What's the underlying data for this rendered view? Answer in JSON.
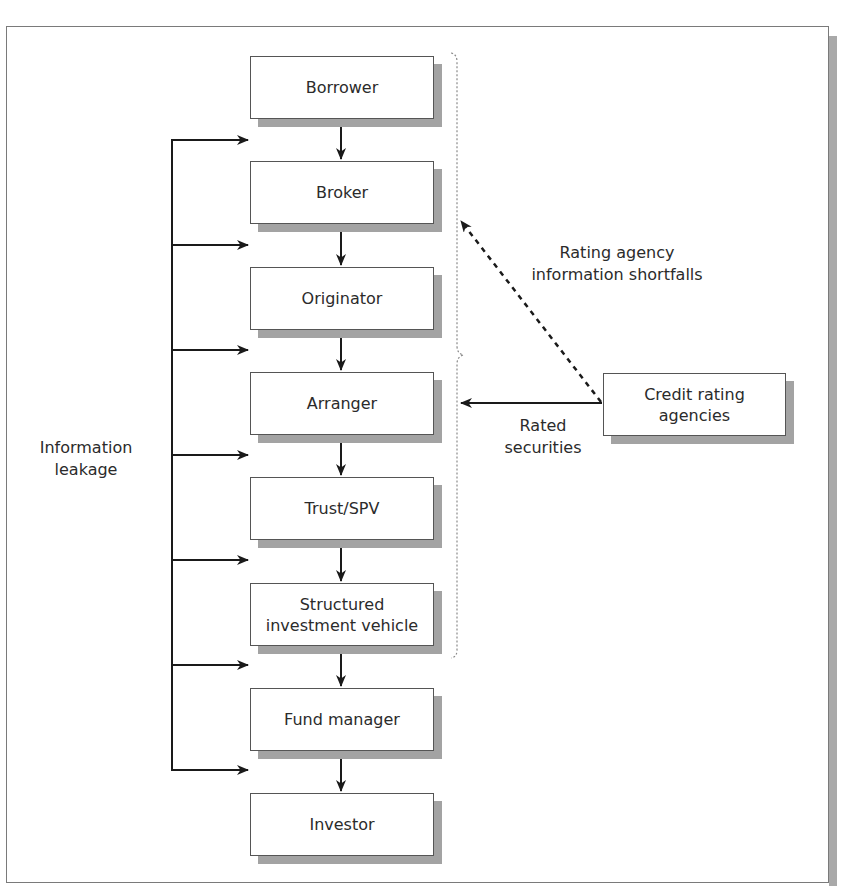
{
  "diagram": {
    "type": "flowchart",
    "chain_nodes": [
      {
        "id": "borrower",
        "label": "Borrower"
      },
      {
        "id": "broker",
        "label": "Broker"
      },
      {
        "id": "originator",
        "label": "Originator"
      },
      {
        "id": "arranger",
        "label": "Arranger"
      },
      {
        "id": "trust_spv",
        "label": "Trust/SPV"
      },
      {
        "id": "siv",
        "label": "Structured investment vehicle"
      },
      {
        "id": "fund_manager",
        "label": "Fund manager"
      },
      {
        "id": "investor",
        "label": "Investor"
      }
    ],
    "side_node": {
      "id": "credit_rating_agencies",
      "label": "Credit rating agencies"
    },
    "labels": {
      "information_leakage": "Information leakage",
      "rating_shortfalls": "Rating agency information shortfalls",
      "rated_securities": "Rated securities"
    },
    "edges": [
      {
        "from": "borrower",
        "to": "broker",
        "style": "solid"
      },
      {
        "from": "broker",
        "to": "originator",
        "style": "solid"
      },
      {
        "from": "originator",
        "to": "arranger",
        "style": "solid"
      },
      {
        "from": "arranger",
        "to": "trust_spv",
        "style": "solid"
      },
      {
        "from": "trust_spv",
        "to": "siv",
        "style": "solid"
      },
      {
        "from": "siv",
        "to": "fund_manager",
        "style": "solid"
      },
      {
        "from": "fund_manager",
        "to": "investor",
        "style": "solid"
      },
      {
        "from": "credit_rating_agencies",
        "to": "brace_upper (Borrower–Originator)",
        "style": "dashed",
        "label": "Rating agency information shortfalls"
      },
      {
        "from": "credit_rating_agencies",
        "to": "brace_lower (Arranger–SIV)",
        "style": "solid",
        "label": "Rated securities"
      },
      {
        "from": "information_leakage",
        "to": "gaps between each chain node (7 arrows)",
        "style": "solid",
        "label": "Information leakage"
      }
    ],
    "colors": {
      "line": "#1a1a1a",
      "box_border": "#555555",
      "shadow": "#a3a3a3",
      "brace": "#8a8a8a"
    }
  }
}
